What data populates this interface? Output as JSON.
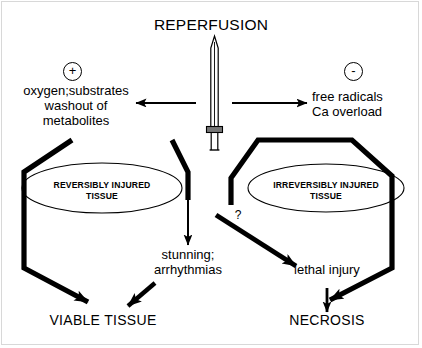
{
  "diagram": {
    "title": "REPERFUSION",
    "central_icon": "sword-icon",
    "branches": {
      "left": {
        "sign": "+",
        "sign_name": "plus-sign",
        "lines": [
          "oxygen;substrates",
          "washout of",
          "metabolites"
        ],
        "ellipse": [
          "REVERSIBLY INJURED",
          "TISSUE"
        ],
        "outcome": "VIABLE TISSUE"
      },
      "right": {
        "sign": "-",
        "sign_name": "minus-sign",
        "lines": [
          "free radicals",
          "Ca overload"
        ],
        "ellipse": [
          "IRREVERSIBLY INJURED",
          "TISSUE"
        ],
        "outcome": "NECROSIS"
      }
    },
    "middle": {
      "lines": [
        "stunning;",
        "arrhythmias"
      ],
      "lethal": "lethal injury",
      "uncertain_marker": "?"
    },
    "colors": {
      "ink": "#000000",
      "background": "#ffffff",
      "frame": "#d8d8d8"
    }
  }
}
